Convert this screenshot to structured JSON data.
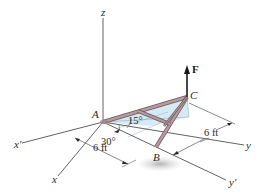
{
  "diagram": {
    "type": "3d-statics-frame",
    "axes": {
      "z": "z",
      "x": "x",
      "x_prime": "x′",
      "y": "y",
      "y_prime": "y′"
    },
    "points": {
      "A": "A",
      "B": "B",
      "C": "C"
    },
    "force": {
      "label": "F",
      "direction": "up"
    },
    "angles": {
      "angle_1": "15°",
      "angle_2": "30°"
    },
    "dimensions": {
      "dim_1": "6 ft",
      "dim_2": "6 ft"
    },
    "colors": {
      "member": "#b59aa0",
      "member_edge": "#6e585c",
      "plane_fill": "#cfe6f2",
      "axis": "#3a3a3a",
      "shadow": "#bdbdbd"
    }
  }
}
